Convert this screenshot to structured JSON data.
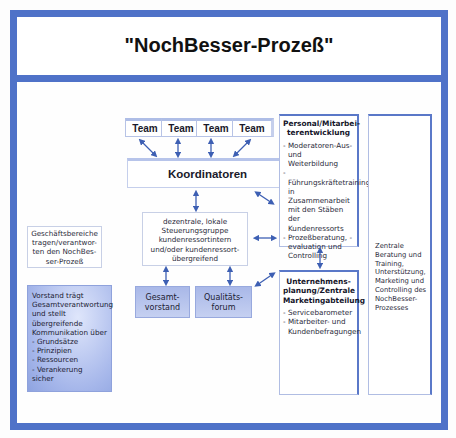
{
  "title": "\"NochBesser-Prozeß\"",
  "teams": [
    {
      "label": "Team"
    },
    {
      "label": "Team"
    },
    {
      "label": "Team"
    },
    {
      "label": "Team"
    }
  ],
  "coordinators": {
    "label": "Koordinatoren"
  },
  "steering_group": {
    "text": "dezentrale, lokale Steuerungsgruppe kundenressortintern und/oder kundenressort-übergreifend"
  },
  "executive_board": {
    "label": "Gesamt-vorstand"
  },
  "quality_forum": {
    "label": "Qualitäts-forum"
  },
  "business_units": {
    "text": "Geschäftsbereiche tragen/verantwor-ten den NochBes-ser-Prozeß"
  },
  "board_note": {
    "intro": "Vorstand trägt Gesamtverantwortung und stellt übergreifende Kommunikation über",
    "items": [
      "Grundsätze",
      "Prinzipien",
      "Ressourcen",
      "Verankerung"
    ],
    "outro": "sicher"
  },
  "personnel": {
    "heading": "Personal/Mitarbei-terentwicklung",
    "items": [
      "Moderatoren-Aus- und Weiterbildung",
      "Führungskräftetraining in Zusammenarbeit mit den Stäben der Kundenressorts",
      "Prozeßberatung, -evaluation und Controlling"
    ]
  },
  "planning": {
    "heading": "Unternehmens-planung/Zentrale Marketingabteilung",
    "items": [
      "Servicebarometer",
      "Mitarbeiter- und Kundenbefragungen"
    ]
  },
  "central_support": {
    "text": "Zentrale Beratung und Training, Unterstützung, Marketing und Controlling des NochBesser-Prozesses"
  },
  "colors": {
    "frame": "#4f72c8",
    "arrow": "#3d5fb3",
    "box_fill": "#b6c4ee"
  }
}
